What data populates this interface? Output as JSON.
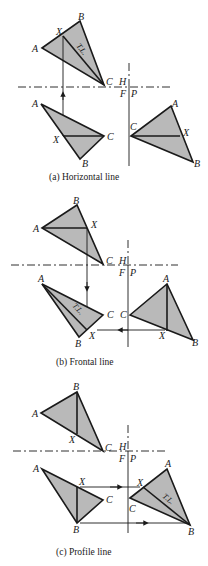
{
  "figure": {
    "panels": [
      {
        "id": "a",
        "caption": "(a)  Horizontal line",
        "fold_labels": {
          "H": "H",
          "F": "F",
          "P": "P"
        },
        "top_view": {
          "A": "A",
          "B": "B",
          "C": "C",
          "X": "X",
          "tl": "T.L."
        },
        "front_view": {
          "A": "A",
          "B": "B",
          "C": "C",
          "X": "X"
        },
        "profile_view": {
          "A": "A",
          "B": "B",
          "C": "C",
          "X": "X"
        }
      },
      {
        "id": "b",
        "caption": "(b)  Frontal line",
        "fold_labels": {
          "H": "H",
          "F": "F",
          "P": "P"
        },
        "top_view": {
          "A": "A",
          "B": "B",
          "C": "C",
          "X": "X"
        },
        "front_view": {
          "A": "A",
          "B": "B",
          "C": "C",
          "X": "X",
          "tl": "T.L."
        },
        "profile_view": {
          "A": "A",
          "B": "B",
          "C": "C",
          "X": "X"
        }
      },
      {
        "id": "c",
        "caption": "(c)  Profile line",
        "fold_labels": {
          "H": "H",
          "F": "F",
          "P": "P"
        },
        "top_view": {
          "A": "A",
          "B": "B",
          "C": "C",
          "X": "X"
        },
        "front_view": {
          "A": "A",
          "B": "B",
          "C": "C",
          "X": "X"
        },
        "profile_view": {
          "A": "A",
          "B": "B",
          "C": "C",
          "X": "X",
          "tl": "T.L."
        }
      }
    ],
    "colors": {
      "fill": "#b9b9b9",
      "stroke": "#1a1a1a",
      "background": "#ffffff"
    }
  }
}
